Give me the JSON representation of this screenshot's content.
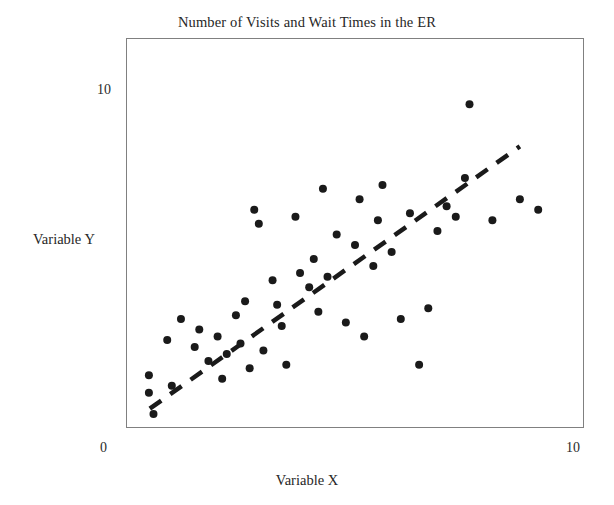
{
  "chart_data": {
    "type": "scatter",
    "title": "Number of Visits and Wait Times in the ER",
    "xlabel": "Variable X",
    "ylabel": "Variable Y",
    "xlim": [
      0,
      10
    ],
    "ylim": [
      0,
      10
    ],
    "xticks": [
      "0",
      "10"
    ],
    "yticks": [
      "0",
      "10"
    ],
    "grid": false,
    "legend": false,
    "marker": {
      "shape": "circle",
      "color": "#1a1a1a",
      "size": 7
    },
    "points": [
      {
        "x": 0.5,
        "y": 1.0
      },
      {
        "x": 0.5,
        "y": 1.5
      },
      {
        "x": 0.6,
        "y": 0.4
      },
      {
        "x": 0.9,
        "y": 2.5
      },
      {
        "x": 1.0,
        "y": 1.2
      },
      {
        "x": 1.2,
        "y": 3.1
      },
      {
        "x": 1.5,
        "y": 2.3
      },
      {
        "x": 1.6,
        "y": 2.8
      },
      {
        "x": 1.8,
        "y": 1.9
      },
      {
        "x": 2.0,
        "y": 2.6
      },
      {
        "x": 2.1,
        "y": 1.4
      },
      {
        "x": 2.2,
        "y": 2.1
      },
      {
        "x": 2.4,
        "y": 3.2
      },
      {
        "x": 2.5,
        "y": 2.4
      },
      {
        "x": 2.6,
        "y": 3.6
      },
      {
        "x": 2.7,
        "y": 1.7
      },
      {
        "x": 2.8,
        "y": 6.2
      },
      {
        "x": 2.9,
        "y": 5.8
      },
      {
        "x": 3.0,
        "y": 2.2
      },
      {
        "x": 3.2,
        "y": 4.2
      },
      {
        "x": 3.3,
        "y": 3.5
      },
      {
        "x": 3.4,
        "y": 2.9
      },
      {
        "x": 3.5,
        "y": 1.8
      },
      {
        "x": 3.7,
        "y": 6.0
      },
      {
        "x": 3.8,
        "y": 4.4
      },
      {
        "x": 4.0,
        "y": 4.0
      },
      {
        "x": 4.1,
        "y": 4.8
      },
      {
        "x": 4.2,
        "y": 3.3
      },
      {
        "x": 4.3,
        "y": 6.8
      },
      {
        "x": 4.4,
        "y": 4.3
      },
      {
        "x": 4.6,
        "y": 5.5
      },
      {
        "x": 4.8,
        "y": 3.0
      },
      {
        "x": 5.0,
        "y": 5.2
      },
      {
        "x": 5.1,
        "y": 6.5
      },
      {
        "x": 5.2,
        "y": 2.6
      },
      {
        "x": 5.4,
        "y": 4.6
      },
      {
        "x": 5.5,
        "y": 5.9
      },
      {
        "x": 5.6,
        "y": 6.9
      },
      {
        "x": 5.8,
        "y": 5.0
      },
      {
        "x": 6.0,
        "y": 3.1
      },
      {
        "x": 6.2,
        "y": 6.1
      },
      {
        "x": 6.4,
        "y": 1.8
      },
      {
        "x": 6.6,
        "y": 3.4
      },
      {
        "x": 6.8,
        "y": 5.6
      },
      {
        "x": 7.0,
        "y": 6.3
      },
      {
        "x": 7.2,
        "y": 6.0
      },
      {
        "x": 7.4,
        "y": 7.1
      },
      {
        "x": 7.5,
        "y": 9.2
      },
      {
        "x": 8.0,
        "y": 5.9
      },
      {
        "x": 8.6,
        "y": 6.5
      },
      {
        "x": 9.0,
        "y": 6.2
      }
    ],
    "trendline": {
      "style": "dashed",
      "color": "#1a1a1a",
      "x0": 0.52,
      "y0": 0.55,
      "x1": 8.6,
      "y1": 8.0
    }
  }
}
